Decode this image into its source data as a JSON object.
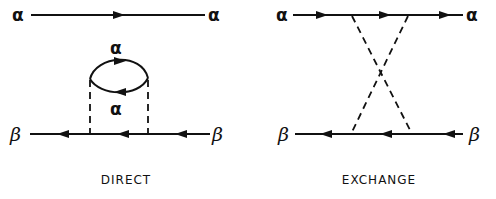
{
  "diagrams": [
    {
      "caption": "DIRECT",
      "labels": {
        "top_left": "α",
        "top_right": "α",
        "loop_top": "α",
        "loop_bottom": "α",
        "bottom_left": "β",
        "bottom_right": "β"
      }
    },
    {
      "caption": "EXCHANGE",
      "labels": {
        "top_left": "α",
        "top_right": "α",
        "bottom_left": "β",
        "bottom_right": "β"
      }
    }
  ]
}
